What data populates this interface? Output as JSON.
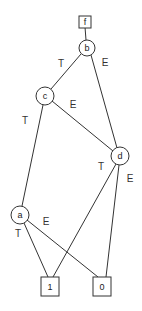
{
  "diagram": {
    "type": "binary-decision-diagram",
    "nodes": [
      {
        "id": "f",
        "label": "f",
        "shape": "box",
        "x": 85,
        "y": 22
      },
      {
        "id": "b",
        "label": "b",
        "shape": "circle",
        "x": 87,
        "y": 48
      },
      {
        "id": "c",
        "label": "c",
        "shape": "circle",
        "x": 45,
        "y": 96
      },
      {
        "id": "d",
        "label": "d",
        "shape": "circle",
        "x": 120,
        "y": 156
      },
      {
        "id": "a",
        "label": "a",
        "shape": "circle",
        "x": 20,
        "y": 215
      },
      {
        "id": "one",
        "label": "1",
        "shape": "box",
        "x": 50,
        "y": 286
      },
      {
        "id": "zero",
        "label": "0",
        "shape": "box",
        "x": 102,
        "y": 286
      }
    ],
    "edges": [
      {
        "from": "f",
        "to": "b",
        "label": ""
      },
      {
        "from": "b",
        "to": "c",
        "label": "T"
      },
      {
        "from": "b",
        "to": "d",
        "label": "E"
      },
      {
        "from": "c",
        "to": "a",
        "label": "T"
      },
      {
        "from": "c",
        "to": "d",
        "label": "E"
      },
      {
        "from": "d",
        "to": "one",
        "label": "T"
      },
      {
        "from": "d",
        "to": "zero",
        "label": "E"
      },
      {
        "from": "a",
        "to": "one",
        "label": "T"
      },
      {
        "from": "a",
        "to": "zero",
        "label": "E"
      }
    ],
    "edge_labels": {
      "b_c": "T",
      "b_d": "E",
      "c_a": "T",
      "c_d": "E",
      "d_one": "T",
      "d_zero": "E",
      "a_one": "T",
      "a_zero": "E"
    },
    "node_labels": {
      "f": "f",
      "b": "b",
      "c": "c",
      "d": "d",
      "a": "a",
      "one": "1",
      "zero": "0"
    }
  }
}
